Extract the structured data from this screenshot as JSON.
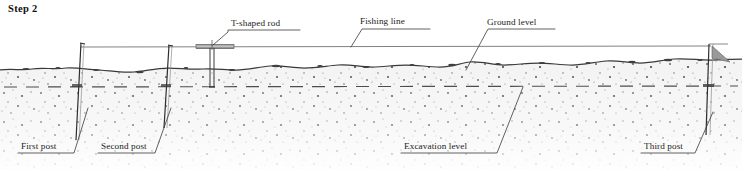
{
  "figure": {
    "step_title": "Step 2",
    "width": 742,
    "height": 170,
    "background_color": "#ffffff",
    "ink_color": "#1b1b1b",
    "soil_color": "#f2f2f2",
    "soil_speckle_color": "#5a5a5a",
    "line_color": "#555555"
  },
  "labels": {
    "t_shaped_rod": "T-shaped rod",
    "fishing_line": "Fishing line",
    "ground_level": "Ground level",
    "first_post": "First post",
    "second_post": "Second post",
    "excavation_level": "Excavation level",
    "third_post": "Third post"
  },
  "elements": {
    "posts": [
      {
        "name": "First post",
        "x": 80
      },
      {
        "name": "Second post",
        "x": 170
      },
      {
        "name": "Third post",
        "x": 711
      }
    ],
    "t_shaped_rod": {
      "x": 212,
      "bar_left": 196,
      "bar_right": 232
    },
    "fishing_line_y": 47,
    "ground_level_y": 70,
    "excavation_level_y": 87
  }
}
